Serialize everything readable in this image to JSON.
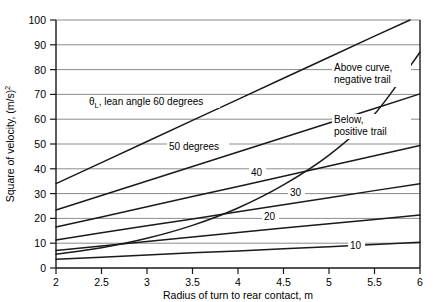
{
  "chart_data": {
    "type": "line",
    "title": "",
    "xlabel": "Radius of turn to rear contact, m",
    "ylabel": "Square of velocity, (m/s)²",
    "xlim": [
      2,
      6
    ],
    "ylim": [
      0,
      100
    ],
    "xticks": [
      2,
      2.5,
      3,
      3.5,
      4,
      4.5,
      5,
      5.5,
      6
    ],
    "xticklabels": [
      "2",
      "2.5",
      "3",
      "3.5",
      "4",
      "4.5",
      "5",
      "5.5",
      "6"
    ],
    "yticks": [
      0,
      10,
      20,
      30,
      40,
      50,
      60,
      70,
      80,
      90,
      100
    ],
    "yticklabels": [
      "0",
      "10",
      "20",
      "30",
      "40",
      "50",
      "60",
      "70",
      "80",
      "90",
      "100"
    ],
    "grid": "horizontal",
    "legend": "inline-annotations",
    "series": [
      {
        "name": "lean angle 60 degrees",
        "label": "θL, lean angle 60 degrees",
        "x": [
          2,
          2.5,
          3,
          3.5,
          4,
          4.5,
          5,
          5.5,
          5.89
        ],
        "values": [
          34.0,
          42.5,
          51.0,
          59.5,
          68.0,
          76.5,
          85.0,
          93.5,
          100.0
        ]
      },
      {
        "name": "50 degrees",
        "label": "50 degrees",
        "x": [
          2,
          2.5,
          3,
          3.5,
          4,
          4.5,
          5,
          5.5,
          6
        ],
        "values": [
          23.4,
          29.2,
          35.1,
          40.9,
          46.8,
          52.6,
          58.5,
          64.3,
          70.2
        ]
      },
      {
        "name": "40 degrees",
        "label": "40",
        "x": [
          2,
          2.5,
          3,
          3.5,
          4,
          4.5,
          5,
          5.5,
          6
        ],
        "values": [
          16.5,
          20.6,
          24.7,
          28.8,
          32.9,
          37.0,
          41.1,
          45.3,
          49.4
        ]
      },
      {
        "name": "30 degrees",
        "label": "30",
        "x": [
          2,
          2.5,
          3,
          3.5,
          4,
          4.5,
          5,
          5.5,
          6
        ],
        "values": [
          11.3,
          14.2,
          17.0,
          19.8,
          22.7,
          25.5,
          28.3,
          31.2,
          34.0
        ]
      },
      {
        "name": "20 degrees",
        "label": "20",
        "x": [
          2,
          2.5,
          3,
          3.5,
          4,
          4.5,
          5,
          5.5,
          6
        ],
        "values": [
          7.1,
          8.9,
          10.7,
          12.5,
          14.3,
          16.1,
          17.8,
          19.6,
          21.4
        ]
      },
      {
        "name": "10 degrees",
        "label": "10",
        "x": [
          2,
          2.5,
          3,
          3.5,
          4,
          4.5,
          5,
          5.5,
          6
        ],
        "values": [
          3.5,
          4.3,
          5.2,
          6.1,
          6.9,
          7.8,
          8.6,
          9.5,
          10.4
        ]
      },
      {
        "name": "zero trail boundary curve",
        "label": "trail boundary",
        "x": [
          2,
          2.5,
          3,
          3.5,
          4,
          4.5,
          5,
          5.5,
          6
        ],
        "values": [
          5.5,
          8.2,
          12.0,
          17.2,
          24.2,
          33.5,
          45.5,
          62.0,
          87.0
        ]
      }
    ],
    "annotations": [
      {
        "id": "lean-angle-60",
        "text": "θL, lean angle 60 degrees",
        "x": 2.55,
        "y": 64
      },
      {
        "id": "fifty-degrees",
        "text": "50 degrees",
        "x": 3.35,
        "y": 44
      },
      {
        "id": "forty-label",
        "text": "40",
        "x": 4.1,
        "y": 33
      },
      {
        "id": "thirty-label",
        "text": "30",
        "x": 4.6,
        "y": 25
      },
      {
        "id": "twenty-label",
        "text": "20",
        "x": 4.45,
        "y": 18
      },
      {
        "id": "ten-label",
        "text": "10",
        "x": 5.3,
        "y": 7
      },
      {
        "id": "above-curve",
        "text": "Above curve, negative trail",
        "x": 5.0,
        "y": 77
      },
      {
        "id": "below-curve",
        "text": "Below, positive trail",
        "x": 5.0,
        "y": 55
      }
    ]
  },
  "labels": {
    "y_axis_prefix": "Square of velocity, (m/s)",
    "y_axis_superscript": "2",
    "x_axis_title": "Radius of turn to rear contact, m",
    "theta_symbol": "θ",
    "theta_subscript": "L",
    "lean_text": ", lean angle 60 degrees",
    "fifty_degrees": "50 degrees",
    "curve_40": "40",
    "curve_30": "30",
    "curve_20": "20",
    "curve_10": "10",
    "above_line1": "Above curve,",
    "above_line2": "negative trail",
    "below_line1": "Below,",
    "below_line2": "positive trail",
    "xt0": "2",
    "xt1": "2.5",
    "xt2": "3",
    "xt3": "3.5",
    "xt4": "4",
    "xt5": "4.5",
    "xt6": "5",
    "xt7": "5.5",
    "xt8": "6",
    "yt0": "0",
    "yt1": "10",
    "yt2": "20",
    "yt3": "30",
    "yt4": "40",
    "yt5": "50",
    "yt6": "60",
    "yt7": "70",
    "yt8": "80",
    "yt9": "90",
    "yt10": "100"
  },
  "colors": {
    "background": "#ffffff",
    "grid": "#8c8c8c",
    "axis": "#1a1a1a",
    "curve": "#1a1a1a",
    "text": "#000000"
  }
}
